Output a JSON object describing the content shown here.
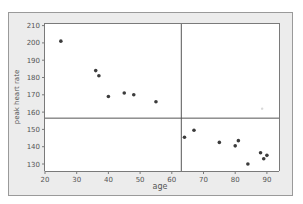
{
  "chart_data": {
    "type": "scatter",
    "title": "",
    "xlabel": "age",
    "ylabel": "peak heart rate",
    "xlim": [
      19,
      93
    ],
    "ylim": [
      126,
      211
    ],
    "xticks": [
      20,
      30,
      40,
      50,
      60,
      70,
      80,
      90
    ],
    "yticks": [
      130,
      140,
      150,
      160,
      170,
      180,
      190,
      200,
      210
    ],
    "grid": false,
    "legend": null,
    "reference_lines": {
      "vertical_x": 63,
      "horizontal_y": 156.5
    },
    "series": [
      {
        "name": "observations",
        "x": [
          25,
          36,
          37,
          40,
          45,
          48,
          55,
          64,
          67,
          75,
          80,
          81,
          84,
          88,
          89,
          90
        ],
        "y": [
          201,
          184,
          181,
          169,
          171,
          170,
          166,
          145.5,
          149.5,
          142.5,
          140.5,
          143.5,
          130,
          136.5,
          133,
          135
        ]
      }
    ],
    "faint_points": {
      "x": [
        88.5
      ],
      "y": [
        162
      ]
    }
  },
  "colors": {
    "panel_bg": "#ececec",
    "panel_border": "#9a9a9a",
    "plot_bg": "#ffffff",
    "axis": "#7a7a7a",
    "marker": "#3c3c3c",
    "ref_line": "#555555",
    "text": "#555555"
  }
}
